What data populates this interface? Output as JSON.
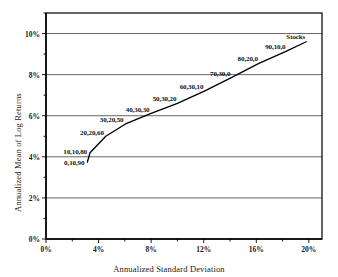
{
  "chart_data": {
    "type": "line",
    "title": "",
    "xlabel": "Annualized Standard Deviation",
    "ylabel": "Annualized Mean of Log Returns",
    "xlim": [
      0,
      21
    ],
    "ylim": [
      0,
      11
    ],
    "grid": true,
    "grid_axis": "y",
    "legend": "none",
    "xticks": [
      0,
      4,
      8,
      12,
      16,
      20
    ],
    "xticklabels": [
      "0%",
      "4%",
      "8%",
      "12%",
      "16%",
      "20%"
    ],
    "xminor_step": 2,
    "yticks": [
      0,
      2,
      4,
      6,
      8,
      10
    ],
    "yticklabels": [
      "0%",
      "2%",
      "4%",
      "6%",
      "8%",
      "10%"
    ],
    "yminor_step": 1,
    "series": [
      {
        "name": "Efficient frontier",
        "x": [
          3.15,
          3.35,
          4.55,
          6.05,
          7.95,
          10.0,
          12.05,
          14.1,
          16.2,
          18.3,
          19.8
        ],
        "y": [
          3.75,
          4.2,
          5.0,
          5.6,
          6.1,
          6.6,
          7.2,
          7.85,
          8.55,
          9.15,
          9.6
        ]
      }
    ],
    "annotations": [
      {
        "text": "0,10,90",
        "x": 3.15,
        "y": 3.75,
        "anchor": "end",
        "dx": -3,
        "dy": 1
      },
      {
        "text": "10,10,80",
        "x": 3.35,
        "y": 4.2,
        "anchor": "end",
        "dx": -3,
        "dy": -1
      },
      {
        "text": "20,20,60",
        "x": 4.55,
        "y": 5.0,
        "anchor": "end",
        "dx": -2,
        "dy": -3
      },
      {
        "text": "30,20,50",
        "x": 6.05,
        "y": 5.6,
        "anchor": "end",
        "dx": -2,
        "dy": -4
      },
      {
        "text": "40,30,30",
        "x": 7.95,
        "y": 6.1,
        "anchor": "end",
        "dx": -1,
        "dy": -4
      },
      {
        "text": "50,30,20",
        "x": 10.0,
        "y": 6.6,
        "anchor": "end",
        "dx": -1,
        "dy": -4
      },
      {
        "text": "60,30,10",
        "x": 12.05,
        "y": 7.2,
        "anchor": "end",
        "dx": -1,
        "dy": -4
      },
      {
        "text": "70,30,0",
        "x": 14.1,
        "y": 7.85,
        "anchor": "end",
        "dx": -1,
        "dy": -4
      },
      {
        "text": "80,20,0",
        "x": 16.2,
        "y": 8.55,
        "anchor": "end",
        "dx": -1,
        "dy": -4
      },
      {
        "text": "90,10,0",
        "x": 18.3,
        "y": 9.15,
        "anchor": "end",
        "dx": -1,
        "dy": -4
      },
      {
        "text": "Stocks",
        "x": 19.8,
        "y": 9.6,
        "anchor": "end",
        "dx": -1,
        "dy": -5
      }
    ],
    "colors": {
      "line": "#000000",
      "axis": "#000000",
      "grid": "#555555",
      "text": "#1a1a1a",
      "background": "#ffffff"
    }
  }
}
